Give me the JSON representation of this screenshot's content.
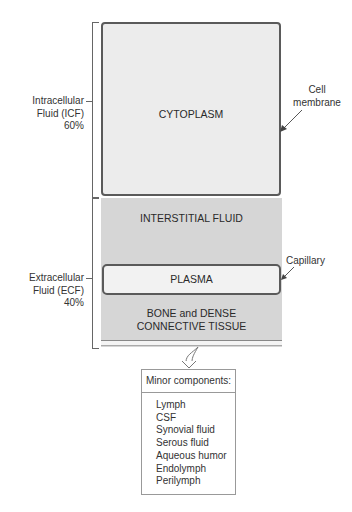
{
  "diagram": {
    "icf": {
      "compartment_label": "CYTOPLASM",
      "side_label_lines": [
        "Intracellular",
        "Fluid (ICF)",
        "60%"
      ],
      "boundary_label_lines": [
        "Cell",
        "membrane"
      ]
    },
    "ecf": {
      "side_label_lines": [
        "Extracellular",
        "Fluid (ECF)",
        "40%"
      ],
      "compartments": [
        {
          "label": "INTERSTITIAL FLUID"
        },
        {
          "label": "PLASMA",
          "boundary_label": "Capillary"
        },
        {
          "label_lines": [
            "BONE and DENSE",
            "CONNECTIVE TISSUE"
          ]
        }
      ]
    },
    "minor_components": {
      "title": "Minor components:",
      "items": [
        "Lymph",
        "CSF",
        "Synovial fluid",
        "Serous fluid",
        "Aqueous humor",
        "Endolymph",
        "Perilymph"
      ]
    },
    "colors": {
      "cytoplasm_fill": "#ececec",
      "ecf_fill": "#d6d6d6",
      "plasma_fill": "#f2f2f2",
      "membrane_stroke": "#5a5a5a"
    }
  }
}
